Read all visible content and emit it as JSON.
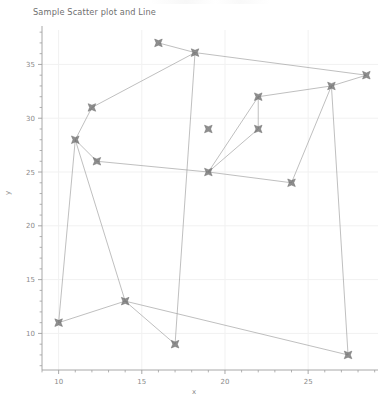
{
  "chart_data": {
    "type": "scatter",
    "title": "Sample Scatter plot and Line",
    "xlabel": "x",
    "ylabel": "y",
    "xlim": [
      9.0,
      29.2
    ],
    "ylim": [
      6.6,
      38.2
    ],
    "xticks": [
      10,
      15,
      20,
      25
    ],
    "yticks": [
      10,
      15,
      20,
      25,
      30,
      35
    ],
    "xtick_labels": [
      "10",
      "15",
      "20",
      "25"
    ],
    "ytick_labels": [
      "10",
      "15",
      "20",
      "25",
      "30",
      "35"
    ],
    "minor_ticks": true,
    "grid": true,
    "legend": null,
    "marker": "x-star",
    "marker_color": "#6e6e6e",
    "line_color": "#9a9a9a",
    "line_connects_points_in_order": true,
    "x": [
      16.0,
      18.2,
      28.5,
      26.4,
      22.0,
      12.0,
      11.0,
      19.0,
      24.0,
      12.3,
      14.0,
      17.0,
      10.0,
      27.4,
      16.0,
      18.2
    ],
    "y": [
      37.0,
      36.1,
      34.0,
      33.0,
      32.0,
      31.0,
      28.0,
      29.0,
      24.0,
      26.0,
      13.0,
      9.0,
      11.0,
      8.0,
      37.0,
      36.1
    ],
    "points": [
      {
        "x": 16.0,
        "y": 37.0
      },
      {
        "x": 18.2,
        "y": 36.1
      },
      {
        "x": 28.5,
        "y": 34.0
      },
      {
        "x": 26.4,
        "y": 33.0
      },
      {
        "x": 22.0,
        "y": 32.0
      },
      {
        "x": 12.0,
        "y": 31.0
      },
      {
        "x": 11.0,
        "y": 28.0
      },
      {
        "x": 19.0,
        "y": 29.0
      },
      {
        "x": 24.0,
        "y": 24.0
      },
      {
        "x": 12.3,
        "y": 26.0
      },
      {
        "x": 14.0,
        "y": 13.0
      },
      {
        "x": 17.0,
        "y": 9.0
      },
      {
        "x": 10.0,
        "y": 11.0
      },
      {
        "x": 27.4,
        "y": 8.0
      },
      {
        "x": 19.0,
        "y": 25.0
      },
      {
        "x": 22.0,
        "y": 29.0
      }
    ],
    "path_order": [
      0,
      1,
      2,
      3,
      4,
      15,
      14,
      9,
      6,
      12,
      10,
      11,
      1,
      5,
      6,
      10,
      13,
      3,
      8,
      14,
      4
    ]
  },
  "figure": {
    "background_color": "#ffffff",
    "axis_color": "#9e9e9e",
    "grid_color": "#f1f1f1",
    "text_color": "#8a8a8a"
  }
}
